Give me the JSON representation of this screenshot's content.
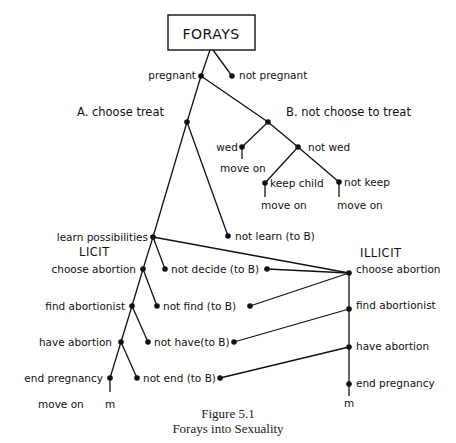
{
  "diagram": {
    "root": "FORAYS",
    "top": {
      "pregnant": "pregnant",
      "not_pregnant": "not pregnant"
    },
    "branch_a": "A. choose treat",
    "branch_b": "B. not choose to treat",
    "b_tree": {
      "wed": "wed",
      "wed_move_on": "move on",
      "not_wed": "not wed",
      "keep_child": "keep child",
      "keep_move_on": "move on",
      "not_keep": "not keep",
      "not_keep_move_on": "move on"
    },
    "learn": "learn possibilities",
    "not_learn": "not learn (to B)",
    "licit": {
      "header": "LICIT",
      "choose_abortion": "choose abortion",
      "not_decide": "not decide (to B)",
      "find_abortionist": "find abortionist",
      "not_find": "not find (to B)",
      "have_abortion": "have abortion",
      "not_have": "not have(to B)",
      "end_pregnancy": "end pregnancy",
      "not_end": "not end (to B)",
      "move_on": "move on",
      "m": "m"
    },
    "illicit": {
      "header": "ILLICIT",
      "choose_abortion": "choose abortion",
      "find_abortionist": "find abortionist",
      "have_abortion": "have abortion",
      "end_pregnancy": "end pregnancy",
      "m": "m"
    }
  },
  "caption": {
    "figure": "Figure 5.1",
    "title": "Forays into Sexuality"
  }
}
